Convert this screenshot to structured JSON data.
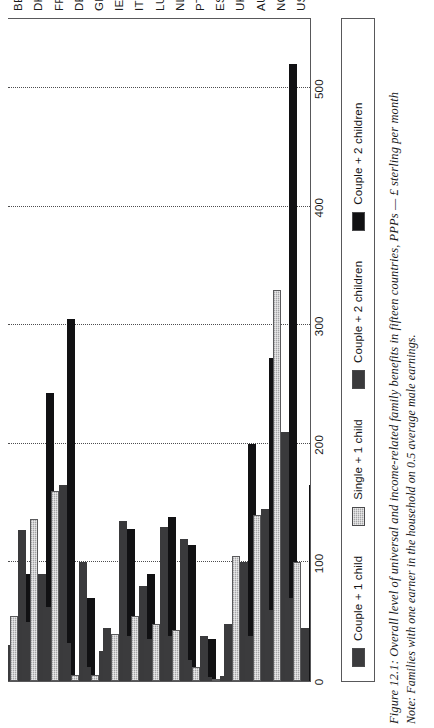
{
  "figure": {
    "caption": "Figure 12.1:  Overall level of universal and income-related family benefits in fifteen countries, PPPs — £ sterling per month",
    "note": "Note: Families with one earner in the household on 0.5 average male earnings."
  },
  "legend": {
    "items": [
      {
        "label": "Couple + 1 child",
        "color": "#3b3b3d",
        "key": "couple_1_child"
      },
      {
        "label": "Single + 1 child",
        "color": "#a5a5a7",
        "key": "single_1_child"
      },
      {
        "label": "Couple + 2 children",
        "color": "#3a3a3c",
        "key": "couple_2_children_a"
      },
      {
        "label": "Couple + 2 children",
        "color": "#111113",
        "key": "couple_2_children_b"
      }
    ]
  },
  "chart_data": {
    "type": "bar",
    "orientation": "horizontal",
    "title": "Overall level of universal and income-related family benefits in fifteen countries, PPPs — £ sterling per month",
    "xlabel": "",
    "ylabel": "£ sterling per month (PPPs)",
    "ylim": [
      0,
      560
    ],
    "ticks": [
      0,
      100,
      200,
      300,
      400,
      500
    ],
    "tick_labels": [
      "0",
      "100",
      "200",
      "300",
      "400",
      "500"
    ],
    "grid": true,
    "legend_position": "below-plot",
    "categories": [
      "BE",
      "DK",
      "FR",
      "DE",
      "GR",
      "IE",
      "IT",
      "LU",
      "NL",
      "PT",
      "ES",
      "UK",
      "AU",
      "NO",
      "US"
    ],
    "series": [
      {
        "name": "Couple + 1 child",
        "color": "#3b3b3d",
        "values": [
          30,
          50,
          62,
          32,
          12,
          45,
          38,
          35,
          38,
          18,
          3,
          48,
          38,
          60,
          70
        ]
      },
      {
        "name": "Single + 1 child",
        "color": "#a5a5a7",
        "values": [
          55,
          137,
          160,
          5,
          5,
          40,
          55,
          48,
          43,
          12,
          2,
          105,
          140,
          330,
          100
        ]
      },
      {
        "name": "Couple + 2 children",
        "color": "#3a3a3c",
        "values": [
          127,
          90,
          165,
          100,
          25,
          135,
          80,
          130,
          120,
          38,
          4,
          100,
          145,
          210,
          45
        ]
      },
      {
        "name": "Couple + 2 children",
        "color": "#111113",
        "values": [
          90,
          243,
          305,
          70,
          20,
          128,
          90,
          138,
          115,
          35,
          32,
          200,
          272,
          520,
          165
        ]
      }
    ]
  }
}
